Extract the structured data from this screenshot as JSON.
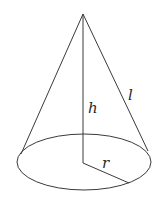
{
  "diagram": {
    "labels": {
      "height": "h",
      "slant": "l",
      "radius": "r"
    },
    "colors": {
      "stroke": "#3a3a3a",
      "background": "#ffffff"
    }
  }
}
